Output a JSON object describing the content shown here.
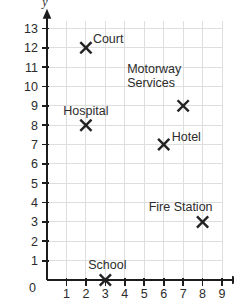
{
  "chart_data": {
    "type": "scatter",
    "title": "",
    "xlabel": "x",
    "ylabel": "y",
    "xlim": [
      0,
      9.6
    ],
    "ylim": [
      0,
      13.6
    ],
    "xticks": [
      1,
      2,
      3,
      4,
      5,
      6,
      7,
      8,
      9
    ],
    "yticks": [
      0,
      1,
      2,
      3,
      4,
      5,
      6,
      7,
      8,
      9,
      10,
      11,
      12,
      13
    ],
    "grid": true,
    "legend": "none",
    "marker_style": "x-cross",
    "points": [
      {
        "label": "Court",
        "x": 2,
        "y": 12,
        "label_lines": [
          "Court"
        ],
        "label_anchor": "start",
        "label_dx": 7,
        "label_dy": -5
      },
      {
        "label": "Motorway Services",
        "x": 7,
        "y": 9,
        "label_lines": [
          "Motorway",
          "Services"
        ],
        "label_anchor": "start",
        "label_dx": -56,
        "label_dy": -19
      },
      {
        "label": "Hospital",
        "x": 2,
        "y": 8,
        "label_lines": [
          "Hospital"
        ],
        "label_anchor": "middle",
        "label_dx": 0,
        "label_dy": -10
      },
      {
        "label": "Hotel",
        "x": 6,
        "y": 7,
        "label_lines": [
          "Hotel"
        ],
        "label_anchor": "start",
        "label_dx": 8,
        "label_dy": -4
      },
      {
        "label": "Fire Station",
        "x": 8,
        "y": 3,
        "label_lines": [
          "Fire Station"
        ],
        "label_anchor": "middle",
        "label_dx": -22,
        "label_dy": -11
      },
      {
        "label": "School",
        "x": 3,
        "y": 0,
        "label_lines": [
          "School"
        ],
        "label_anchor": "middle",
        "label_dx": 2,
        "label_dy": -11
      }
    ],
    "colors": {
      "grid": "#dedede",
      "axis": "#1c1c1c",
      "marker": "#222222",
      "text": "#2b2b2b",
      "background": "#ffffff"
    }
  },
  "axes": {
    "x_axis_name": "x",
    "y_axis_name": "y",
    "origin_label": "0"
  }
}
